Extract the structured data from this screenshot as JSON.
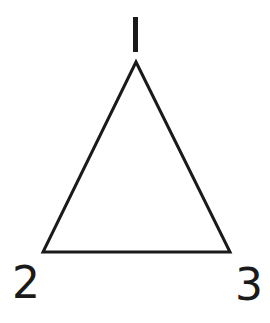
{
  "diagram": {
    "type": "triangle",
    "stroke_color": "#1a1a1a",
    "background": "#ffffff",
    "vertices": [
      {
        "label": "1",
        "x": 136,
        "y": 62
      },
      {
        "label": "2",
        "x": 43,
        "y": 252
      },
      {
        "label": "3",
        "x": 230,
        "y": 252
      }
    ]
  }
}
